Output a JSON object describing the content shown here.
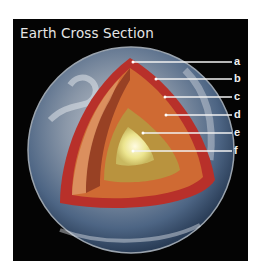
{
  "title": "Earth Cross Section",
  "labels": [
    {
      "letter": "a",
      "y": 62
    },
    {
      "letter": "b",
      "y": 79
    },
    {
      "letter": "c",
      "y": 97
    },
    {
      "letter": "d",
      "y": 115
    },
    {
      "letter": "e",
      "y": 133
    },
    {
      "letter": "f",
      "y": 151
    }
  ],
  "colors": {
    "background": "#040404",
    "crust": "#c0392b",
    "mantle": "#c9622e",
    "outer_core": "#b7893a",
    "inner_core": "#f3eeb0"
  }
}
